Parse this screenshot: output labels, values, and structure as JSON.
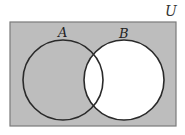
{
  "diagram": {
    "type": "venn",
    "universe_label": "U",
    "sets": [
      {
        "name": "A",
        "label": "A"
      },
      {
        "name": "B",
        "label": "B"
      }
    ],
    "shaded_region": "complement of B (U minus B)",
    "colors": {
      "shade": "#bdbdbd",
      "unshaded": "#ffffff",
      "outline": "#2a2a2a",
      "border": "#777777"
    }
  }
}
